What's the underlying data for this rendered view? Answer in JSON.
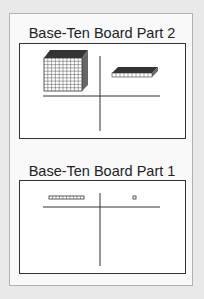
{
  "boards": [
    {
      "title": "Base-Ten Board Part 2",
      "left_column_contents": "cube",
      "right_column_contents": "flat"
    },
    {
      "title": "Base-Ten Board Part 1",
      "left_column_contents": "long",
      "right_column_contents": "unit"
    }
  ],
  "colors": {
    "background": "#e9e9e9",
    "card": "#f9f9f9",
    "line": "#333333"
  }
}
